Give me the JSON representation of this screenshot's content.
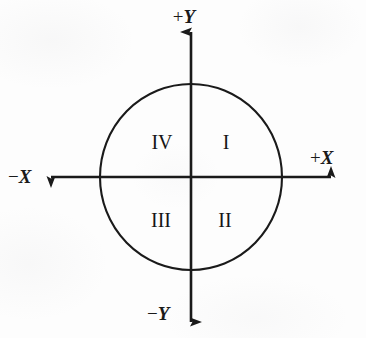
{
  "figure": {
    "name": "quadrant-circle-diagram",
    "background_color": "#fdfdfd",
    "stroke_color": "#1a1a1a"
  },
  "axes": {
    "positive_y": {
      "sign": "+",
      "variable": "Y",
      "label": "+Y"
    },
    "negative_y": {
      "sign": "−",
      "variable": "Y",
      "label": "−Y"
    },
    "positive_x": {
      "sign": "+",
      "variable": "X",
      "label": "+X"
    },
    "negative_x": {
      "sign": "−",
      "variable": "X",
      "label": "−X"
    }
  },
  "quadrants": [
    {
      "id": "quadrant-upper-right",
      "label": "I",
      "position": "upper-right"
    },
    {
      "id": "quadrant-lower-right",
      "label": "II",
      "position": "lower-right"
    },
    {
      "id": "quadrant-lower-left",
      "label": "III",
      "position": "lower-left"
    },
    {
      "id": "quadrant-upper-left",
      "label": "IV",
      "position": "upper-left"
    }
  ],
  "geometry": {
    "origin_x": 191,
    "origin_y": 177,
    "radius_x": 91,
    "radius_y": 93
  }
}
